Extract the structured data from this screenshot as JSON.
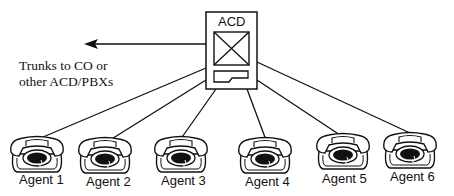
{
  "diagram": {
    "hub": {
      "label": "ACD",
      "icon": "acd-switch-icon"
    },
    "trunk": {
      "label_line1": "Trunks to CO or",
      "label_line2": "other ACD/PBXs",
      "icon": "arrow-left-icon"
    },
    "agents": [
      {
        "label": "Agent 1",
        "icon": "telephone-icon"
      },
      {
        "label": "Agent 2",
        "icon": "telephone-icon"
      },
      {
        "label": "Agent 3",
        "icon": "telephone-icon"
      },
      {
        "label": "Agent 4",
        "icon": "telephone-icon"
      },
      {
        "label": "Agent 5",
        "icon": "telephone-icon"
      },
      {
        "label": "Agent 6",
        "icon": "telephone-icon"
      }
    ]
  }
}
